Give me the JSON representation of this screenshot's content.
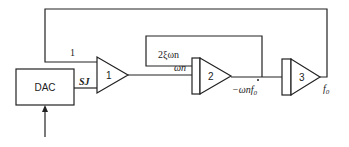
{
  "diagram": {
    "type": "analog-computer block diagram",
    "dac": {
      "label": "DAC"
    },
    "amplifiers": [
      {
        "id": "amp1",
        "label": "1",
        "kind": "summer"
      },
      {
        "id": "amp2",
        "label": "2",
        "kind": "integrator"
      },
      {
        "id": "amp3",
        "label": "3",
        "kind": "integrator"
      }
    ],
    "signals": {
      "feedback_gain": "1",
      "dac_output": "SJ",
      "amp1_output_gain": "ωn",
      "damping_feedback": "2ξωn",
      "amp2_output_main": "−ωn",
      "amp2_output_var": "f",
      "amp2_output_sub": "0",
      "amp3_output_var": "f",
      "amp3_output_sub": "0"
    }
  }
}
